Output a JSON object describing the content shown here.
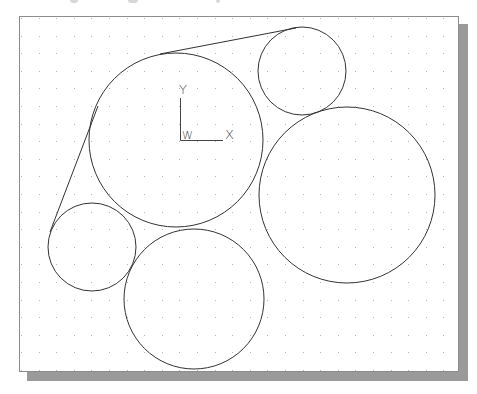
{
  "viewport": {
    "background": "#ffffff",
    "border_color": "#8c8c8c",
    "shadow_color": "#9a9a9a",
    "grid": {
      "dot_color": "#b5b5b5",
      "spacing_x": 17.6,
      "spacing_y": 17.6,
      "origin_x": 21,
      "origin_y": 18
    }
  },
  "ucs_icon": {
    "y_label": "Y",
    "x_label": "X",
    "w_label": "W"
  },
  "drawing": {
    "stroke_color": "#333333",
    "circles": [
      {
        "name": "center-large",
        "cx": 176,
        "cy": 140,
        "r": 87
      },
      {
        "name": "top-right-small",
        "cx": 302,
        "cy": 71,
        "r": 44
      },
      {
        "name": "right-large",
        "cx": 347,
        "cy": 195,
        "r": 88
      },
      {
        "name": "left-small",
        "cx": 92,
        "cy": 247,
        "r": 44
      },
      {
        "name": "bottom-medium",
        "cx": 194,
        "cy": 299,
        "r": 70
      }
    ],
    "lines": [
      {
        "name": "top-tangent",
        "x1": 160,
        "y1": 54,
        "x2": 296,
        "y2": 28
      },
      {
        "name": "left-tangent",
        "x1": 98,
        "y1": 106,
        "x2": 50,
        "y2": 232
      }
    ]
  }
}
